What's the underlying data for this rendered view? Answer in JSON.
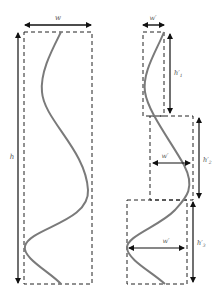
{
  "diagram": {
    "colors": {
      "curve": "#7a7a7a",
      "box": "#222222",
      "arrow": "#111111",
      "label": "#555555",
      "background": "#ffffff"
    },
    "left_panel": {
      "width_label": "w",
      "height_label": "h"
    },
    "right_panel": {
      "segments": [
        {
          "width_label": "w′",
          "height_label": "h′",
          "height_sub": "1"
        },
        {
          "width_label": "w′",
          "height_label": "h′",
          "height_sub": "2"
        },
        {
          "width_label": "w′",
          "height_label": "h′",
          "height_sub": "3"
        }
      ]
    }
  }
}
